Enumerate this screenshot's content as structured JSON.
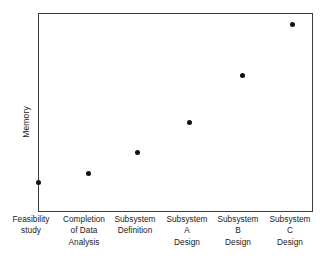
{
  "chart_data": {
    "type": "scatter",
    "title": "",
    "xlabel": "",
    "ylabel": "Memory",
    "grid": false,
    "legend": null,
    "xlim": [
      0,
      7
    ],
    "ylim": [
      0,
      10
    ],
    "axis_tick_values_shown": false,
    "categories": [
      "Feasibility study",
      "Completion of Data Analysis",
      "Subsystem Definition",
      "Subsystem A Design",
      "Subsystem B Design",
      "Subsystem C Design"
    ],
    "category_labels_multiline": [
      "Feasibility\nstudy",
      "Completion\nof Data\nAnalysis",
      "Subsystem\nDefinition",
      "Subsystem\nA\nDesign",
      "Subsystem\nB\nDesign",
      "Subsystem\nC\nDesign"
    ],
    "series": [
      {
        "name": "Memory",
        "marker": "filled-circle",
        "color": "#111111",
        "values": [
          1.5,
          2.0,
          3.0,
          4.5,
          6.9,
          9.4
        ]
      }
    ],
    "points": [
      {
        "label": "Feasibility study",
        "x": 0.5,
        "y": 1.5,
        "px": 38.5,
        "py": 182.0
      },
      {
        "label": "Completion of Data Analysis",
        "x": 1.5,
        "y": 2.0,
        "px": 88.5,
        "py": 173.5
      },
      {
        "label": "Subsystem Definition",
        "x": 2.5,
        "y": 3.0,
        "px": 137.0,
        "py": 152.0
      },
      {
        "label": "Subsystem A Design",
        "x": 3.5,
        "y": 4.5,
        "px": 189.0,
        "py": 122.5
      },
      {
        "label": "Subsystem B Design",
        "x": 4.5,
        "y": 6.9,
        "px": 242.0,
        "py": 75.0
      },
      {
        "label": "Subsystem C Design",
        "x": 5.5,
        "y": 9.4,
        "px": 292.0,
        "py": 24.0
      }
    ]
  },
  "axes": {
    "y_title": "Memory",
    "frame_color": "#3c3c3c",
    "background_color": "#ffffff",
    "marker_color": "#111111"
  },
  "x_label_positions_px": [
    31,
    84,
    135,
    187,
    238,
    290
  ]
}
